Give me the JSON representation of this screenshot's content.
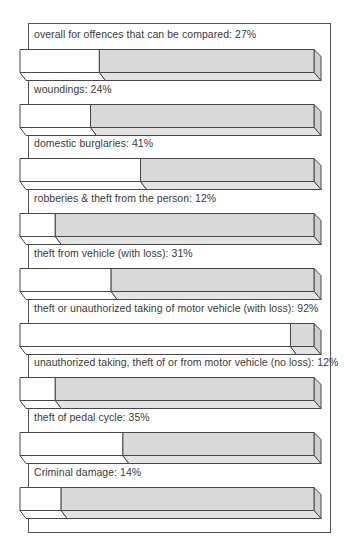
{
  "chart_data": {
    "type": "bar",
    "orientation": "horizontal",
    "style": "3d-stacked-percentage",
    "title": "",
    "xlabel": "",
    "ylabel": "",
    "xlim": [
      0,
      100
    ],
    "unit": "%",
    "grid": false,
    "legend": null,
    "categories": [
      "overall for offences that can be compared",
      "woundings",
      "domestic burglaries",
      "robberies & theft from the person",
      "theft from vehicle (with loss)",
      "theft or unauthorized taking of motor vehicle (with loss)",
      "unauthorized taking, theft of or from motor vehicle (no loss)",
      "theft of pedal cycle",
      "Criminal damage"
    ],
    "values": [
      27,
      24,
      41,
      12,
      31,
      92,
      12,
      35,
      14
    ],
    "labels": [
      "overall for offences that can be compared: 27%",
      "woundings: 24%",
      "domestic burglaries: 41%",
      "robberies & theft from the person: 12%",
      "theft from vehicle (with loss): 31%",
      "theft or unauthorized taking of motor vehicle (with loss): 92%",
      "unauthorized taking, theft of or from motor vehicle (no loss): 12%",
      "theft of pedal cycle: 35%",
      "Criminal damage: 14%"
    ],
    "series": [
      {
        "name": "percentage (white portion)",
        "color": "#ffffff",
        "values": [
          27,
          24,
          41,
          12,
          31,
          92,
          12,
          35,
          14
        ]
      },
      {
        "name": "remainder (grey portion)",
        "color": "#d9d9d9",
        "values": [
          73,
          76,
          59,
          88,
          69,
          8,
          88,
          65,
          86
        ]
      }
    ]
  },
  "colors": {
    "outline": "#474747",
    "grey_front": "#d9d9d9",
    "grey_bevel": "#e3e3e3",
    "grey_end": "#cfcfcf",
    "white": "#ffffff",
    "text": "#3a3a3a",
    "frame": "#555555"
  }
}
